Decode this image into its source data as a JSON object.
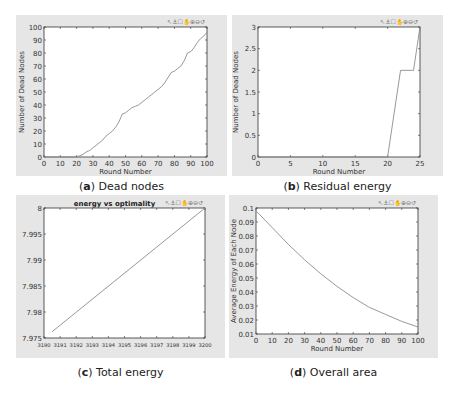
{
  "toolbar_icons": [
    "zoom-in-icon",
    "zoom-out-icon",
    "pan-icon",
    "rotate-icon",
    "data-cursor-icon",
    "brush-icon",
    "reset-view-icon"
  ],
  "toolbar_glyphs": "↖⚓☐✋⊕⊖↺",
  "captions": {
    "a": {
      "letter": "(a)",
      "text": " Dead nodes",
      "prefix": "(",
      "bold": "a",
      "suffix": ") Dead nodes"
    },
    "b": {
      "prefix": "(",
      "bold": "b",
      "suffix": ") Residual energy"
    },
    "c": {
      "prefix": "(",
      "bold": "c",
      "suffix": ") Total energy"
    },
    "d": {
      "prefix": "(",
      "bold": "d",
      "suffix": ") Overall area"
    }
  },
  "chart_data": [
    {
      "id": "a",
      "type": "line",
      "title": "",
      "xlabel": "Round Number",
      "ylabel": "Number of Dead Nodes",
      "xlim": [
        0,
        100
      ],
      "ylim": [
        0,
        100
      ],
      "xticks": [
        0,
        10,
        20,
        30,
        40,
        50,
        60,
        70,
        80,
        90,
        100
      ],
      "yticks": [
        0,
        10,
        20,
        30,
        40,
        50,
        60,
        70,
        80,
        90,
        100
      ],
      "grid": false,
      "x": [
        0,
        20,
        22,
        24,
        26,
        28,
        30,
        32,
        34,
        36,
        38,
        40,
        42,
        44,
        46,
        48,
        50,
        52,
        54,
        56,
        58,
        60,
        62,
        64,
        66,
        68,
        70,
        72,
        74,
        76,
        78,
        80,
        82,
        84,
        86,
        88,
        90,
        92,
        94,
        96,
        98,
        100
      ],
      "values": [
        0,
        0,
        1,
        2,
        4,
        5,
        7,
        9,
        11,
        13,
        16,
        18,
        20,
        23,
        27,
        33,
        34,
        36,
        38,
        39,
        40,
        42,
        44,
        46,
        48,
        50,
        52,
        54,
        57,
        61,
        65,
        66,
        68,
        70,
        74,
        80,
        81,
        84,
        88,
        91,
        93,
        96
      ]
    },
    {
      "id": "b",
      "type": "line",
      "title": "",
      "xlabel": "Round Number",
      "ylabel": "Number of Dead Nodes",
      "xlim": [
        0,
        25
      ],
      "ylim": [
        0,
        3
      ],
      "xticks": [
        0,
        5,
        10,
        15,
        20,
        25
      ],
      "yticks": [
        0,
        0.5,
        1,
        1.5,
        2,
        2.5,
        3
      ],
      "grid": false,
      "x": [
        0,
        20,
        22,
        24,
        25
      ],
      "values": [
        0,
        0,
        2,
        2,
        3
      ]
    },
    {
      "id": "c",
      "type": "line",
      "title": "energy vs optimality",
      "xlabel": "",
      "ylabel": "",
      "xlim": [
        3190,
        3200
      ],
      "ylim": [
        7.975,
        8
      ],
      "xticks": [
        3190,
        3191,
        3192,
        3193,
        3194,
        3195,
        3196,
        3197,
        3198,
        3199,
        3200
      ],
      "yticks": [
        7.975,
        7.98,
        7.985,
        7.99,
        7.995,
        8
      ],
      "ytick_labels": [
        "7.975",
        "7.98",
        "7.985",
        "7.99",
        "7.995",
        "8"
      ],
      "grid": false,
      "x": [
        3190.5,
        3200
      ],
      "values": [
        7.9762,
        8.0
      ]
    },
    {
      "id": "d",
      "type": "line",
      "title": "",
      "xlabel": "Round Number",
      "ylabel": "Average Energy of Each Node",
      "xlim": [
        0,
        100
      ],
      "ylim": [
        0.01,
        0.1
      ],
      "xticks": [
        0,
        10,
        20,
        30,
        40,
        50,
        60,
        70,
        80,
        90,
        100
      ],
      "yticks": [
        0.01,
        0.02,
        0.03,
        0.04,
        0.05,
        0.06,
        0.07,
        0.08,
        0.09,
        0.1
      ],
      "ytick_labels": [
        "0.01",
        "0.02",
        "0.03",
        "0.04",
        "0.05",
        "0.06",
        "0.07",
        "0.08",
        "0.09",
        "0.1"
      ],
      "grid": false,
      "x": [
        0,
        10,
        20,
        30,
        40,
        50,
        60,
        70,
        80,
        90,
        100
      ],
      "values": [
        0.098,
        0.086,
        0.074,
        0.063,
        0.053,
        0.044,
        0.036,
        0.029,
        0.024,
        0.019,
        0.015
      ]
    }
  ],
  "layout": {
    "panels": [
      {
        "id": "a",
        "px": 16,
        "py": 15,
        "pw": 211,
        "ph": 161,
        "ax": 44,
        "ay": 27,
        "aw": 163,
        "ah": 130
      },
      {
        "id": "b",
        "px": 232,
        "py": 15,
        "pw": 211,
        "ph": 161,
        "ax": 258,
        "ay": 27,
        "aw": 162,
        "ah": 130
      },
      {
        "id": "c",
        "px": 16,
        "py": 195,
        "pw": 209,
        "ph": 163,
        "ax": 44,
        "ay": 208,
        "aw": 161,
        "ah": 130
      },
      {
        "id": "d",
        "px": 229,
        "py": 195,
        "pw": 209,
        "ph": 163,
        "ax": 256,
        "ay": 208,
        "aw": 162,
        "ah": 126
      }
    ]
  }
}
